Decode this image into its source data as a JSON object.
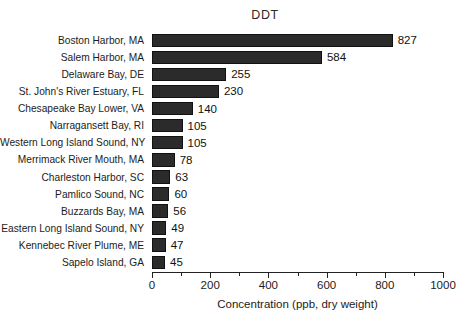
{
  "chart_data": {
    "type": "bar",
    "orientation": "horizontal",
    "title": "DDT",
    "xlabel": "Concentration (ppb, dry weight)",
    "ylabel": "",
    "xlim": [
      0,
      1000
    ],
    "grid": false,
    "legend": null,
    "xticks": [
      0,
      200,
      400,
      600,
      800,
      1000
    ],
    "xtick_labels": [
      "0",
      "200",
      "400",
      "600",
      "800",
      "1000"
    ],
    "minor_xticks": [
      100,
      300,
      500,
      700,
      900
    ],
    "categories": [
      "Boston Harbor, MA",
      "Salem Harbor, MA",
      "Delaware Bay, DE",
      "St. John's River Estuary, FL",
      "Chesapeake Bay Lower, VA",
      "Narragansett Bay, RI",
      "Western Long Island Sound, NY",
      "Merrimack River Mouth, MA",
      "Charleston Harbor, SC",
      "Pamlico Sound, NC",
      "Buzzards Bay, MA",
      "Eastern Long Island Sound, NY",
      "Kennebec River Plume, ME",
      "Sapelo Island, GA"
    ],
    "values": [
      827,
      584,
      255,
      230,
      140,
      105,
      105,
      78,
      63,
      60,
      56,
      49,
      47,
      45
    ],
    "value_labels": [
      "827",
      "584",
      "255",
      "230",
      "140",
      "105",
      "105",
      "78",
      "63",
      "60",
      "56",
      "49",
      "47",
      "45"
    ],
    "bar_color": "#2b2b2b",
    "bar_edge_color": "#111111",
    "background_color": "#ffffff"
  }
}
